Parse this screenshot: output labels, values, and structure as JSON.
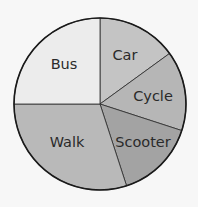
{
  "chart_data": {
    "type": "pie",
    "title": "",
    "start_angle_deg": 0,
    "direction": "clockwise",
    "categories": [
      "Car",
      "Cycle",
      "Scooter",
      "Walk",
      "Bus"
    ],
    "values": [
      15,
      15,
      15,
      30,
      25
    ],
    "unit": "percent",
    "slices": [
      {
        "label": "Car",
        "percent": 15,
        "degrees": 54,
        "color": "#c4c4c4"
      },
      {
        "label": "Cycle",
        "percent": 15,
        "degrees": 54,
        "color": "#b6b6b6"
      },
      {
        "label": "Scooter",
        "percent": 15,
        "degrees": 54,
        "color": "#a3a3a3"
      },
      {
        "label": "Walk",
        "percent": 30,
        "degrees": 108,
        "color": "#b9b9b9"
      },
      {
        "label": "Bus",
        "percent": 25,
        "degrees": 90,
        "color": "#ececec"
      }
    ],
    "legend": "none (labels inside slices)",
    "grid": false
  },
  "colors": {
    "background": "#f7f7f7",
    "outline": "#1a1a1a",
    "text": "#2a2a2a"
  }
}
